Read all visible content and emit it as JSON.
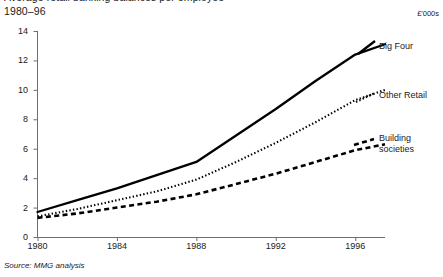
{
  "header": {
    "clipped_title": "Average retail banking balances per employee",
    "subtitle": "1980–96",
    "units": "£'000s"
  },
  "source": "Source: MMG analysis",
  "legend": [
    {
      "name": "big-four",
      "label": "Big Four",
      "style": "solid"
    },
    {
      "name": "other-retail",
      "label": "Other Retail",
      "style": "dotted"
    },
    {
      "name": "building-societies",
      "label_line1": "Building",
      "label_line2": "societies",
      "style": "dashed"
    }
  ],
  "chart_data": {
    "type": "line",
    "title": "Average retail banking balances per employee",
    "subtitle": "1980–96",
    "xlabel": "",
    "ylabel": "£'000s",
    "xlim": [
      1980,
      1997.5
    ],
    "ylim": [
      0,
      14
    ],
    "xticks": [
      1980,
      1984,
      1988,
      1992,
      1996
    ],
    "yticks": [
      0,
      2,
      4,
      6,
      8,
      10,
      12,
      14
    ],
    "grid": false,
    "legend_position": "right",
    "x": [
      1980,
      1982,
      1984,
      1986,
      1988,
      1990,
      1992,
      1994,
      1996,
      1997.5
    ],
    "series": [
      {
        "name": "Big Four",
        "style": "solid",
        "color": "#000000",
        "values": [
          1.7,
          2.5,
          3.3,
          4.2,
          5.1,
          6.9,
          8.7,
          10.6,
          12.4,
          13.1
        ]
      },
      {
        "name": "Other Retail",
        "style": "dotted",
        "color": "#000000",
        "values": [
          1.4,
          1.9,
          2.5,
          3.1,
          3.9,
          5.1,
          6.4,
          7.8,
          9.3,
          10.0
        ]
      },
      {
        "name": "Building societies",
        "style": "dashed",
        "color": "#000000",
        "values": [
          1.3,
          1.6,
          2.0,
          2.4,
          2.9,
          3.6,
          4.3,
          5.1,
          5.9,
          6.3
        ]
      }
    ]
  }
}
